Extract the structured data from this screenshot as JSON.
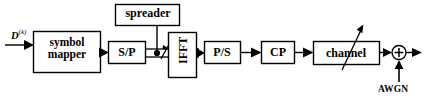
{
  "diagram": {
    "stroke_color": "#000000",
    "background_color": "#ffffff",
    "blocks": [
      {
        "id": "symbol_mapper",
        "label": "symbol mapper",
        "line1": "symbol",
        "line2": "mapper"
      },
      {
        "id": "sp",
        "label": "S/P"
      },
      {
        "id": "spreader",
        "label": "spreader"
      },
      {
        "id": "ifft",
        "label": "IFFT"
      },
      {
        "id": "ps",
        "label": "P/S"
      },
      {
        "id": "cp",
        "label": "CP"
      },
      {
        "id": "channel",
        "label": "channel"
      }
    ],
    "signals": {
      "input_label": "D",
      "input_superscript": "(k)",
      "noise_label": "AWGN",
      "adder_symbol": "+"
    }
  }
}
